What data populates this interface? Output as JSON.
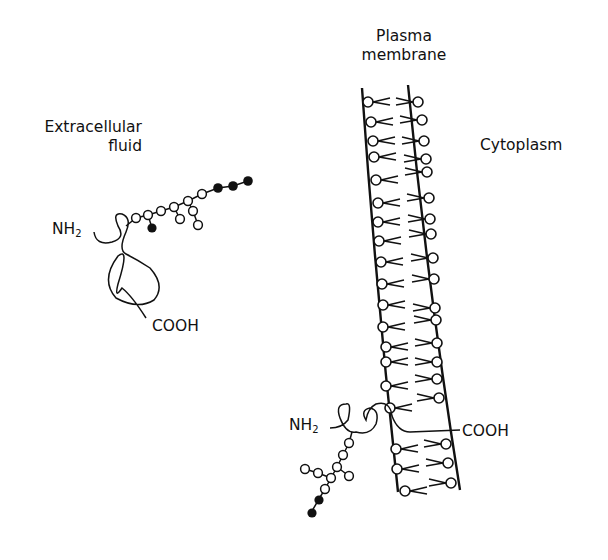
{
  "labels": {
    "plasma_membrane": [
      "Plasma",
      "membrane"
    ],
    "extracellular_fluid": [
      "Extracellular",
      "fluid"
    ],
    "cytoplasm": "Cytoplasm",
    "free_protein_nh2": "NH",
    "free_protein_nh2_sub": "2",
    "free_protein_cooh": "COOH",
    "membrane_protein_nh2": "NH",
    "membrane_protein_nh2_sub": "2",
    "membrane_protein_cooh": "COOH"
  },
  "colors": {
    "ink": "#111111",
    "background": "#ffffff"
  },
  "structures": {
    "free_glycoprotein": {
      "description": "Secreted glycoprotein with branched oligosaccharide chain",
      "open_sugar_residues": 11,
      "filled_sugar_residues": 4
    },
    "membrane_glycoprotein": {
      "description": "Transmembrane glycoprotein with branched oligosaccharide on extracellular side",
      "open_sugar_residues": 11,
      "filled_sugar_residues": 2
    },
    "lipid_bilayer": {
      "outer_leaflet_lipids": 22,
      "inner_leaflet_lipids": 22
    }
  }
}
